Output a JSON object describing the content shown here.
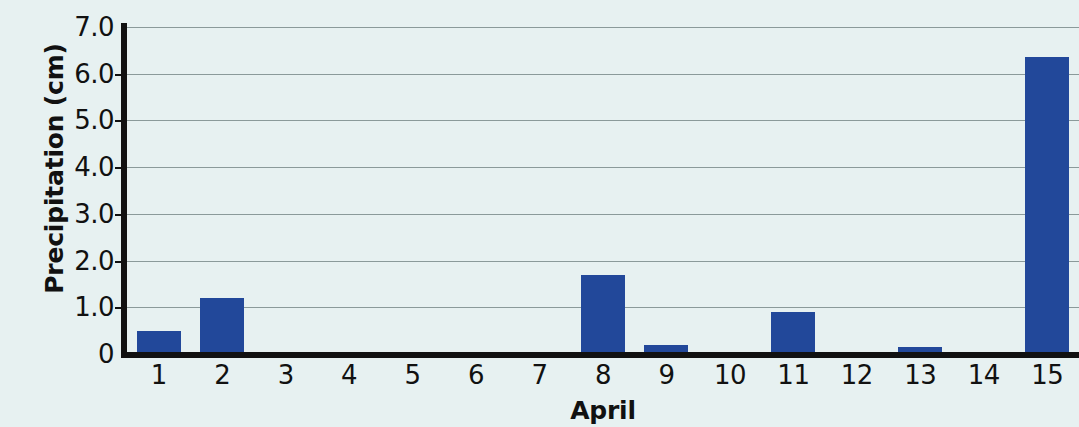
{
  "chart_data": {
    "type": "bar",
    "title": "",
    "subtitle": "",
    "xlabel": "April",
    "ylabel": "Precipitation (cm)",
    "categories": [
      "1",
      "2",
      "3",
      "4",
      "5",
      "6",
      "7",
      "8",
      "9",
      "10",
      "11",
      "12",
      "13",
      "14",
      "15"
    ],
    "values": [
      0.5,
      1.2,
      0,
      0,
      0,
      0,
      0,
      1.7,
      0.2,
      0,
      0.9,
      0,
      0.15,
      0,
      6.35
    ],
    "ylim": [
      0,
      7.0
    ],
    "y_ticks": [
      0,
      1.0,
      2.0,
      3.0,
      4.0,
      5.0,
      6.0,
      7.0
    ],
    "y_tick_labels": [
      "0",
      "1.0",
      "2.0",
      "3.0",
      "4.0",
      "5.0",
      "6.0",
      "7.0"
    ],
    "grid": true,
    "grid_axis": "y",
    "legend": false,
    "legend_position": "none",
    "series": [
      {
        "name": "Precipitation",
        "values": [
          0.5,
          1.2,
          0,
          0,
          0,
          0,
          0,
          1.7,
          0.2,
          0,
          0.9,
          0,
          0.15,
          0,
          6.35
        ]
      }
    ],
    "annotations": []
  },
  "colors": {
    "bar": "#22489a",
    "background": "#e7f1f1",
    "axis": "#111111",
    "gridline": "#8b9a9a",
    "text": "#111111"
  }
}
